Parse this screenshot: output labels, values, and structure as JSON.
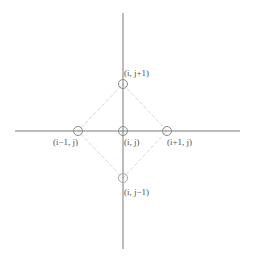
{
  "diagram": {
    "title": "",
    "colors": {
      "axis": "#7a7a7a",
      "node_stroke": "#8a8a8a",
      "diamond": "#d8d8d8",
      "label": "#555555",
      "background": "#ffffff"
    },
    "axes": {
      "horizontal": {
        "x1": 15,
        "y": 131,
        "x2": 240
      },
      "vertical": {
        "x": 123,
        "y1": 13,
        "y2": 249
      }
    },
    "nodes": [
      {
        "id": "center",
        "label": "(i, j)",
        "cx": 123,
        "cy": 131
      },
      {
        "id": "top",
        "label": "(i, j+1)",
        "cx": 123,
        "cy": 84
      },
      {
        "id": "bottom",
        "label": "(i, j−1)",
        "cx": 123,
        "cy": 178
      },
      {
        "id": "left",
        "label": "(i−1, j)",
        "cx": 78,
        "cy": 131
      },
      {
        "id": "right",
        "label": "(i+1, j)",
        "cx": 167,
        "cy": 131
      }
    ],
    "labels": {
      "center": "(i, j)",
      "top": "(i, j+1)",
      "bottom": "(i, j−1)",
      "left": "(i−1, j)",
      "right": "(i+1, j)"
    },
    "node_radius": 4.5
  }
}
